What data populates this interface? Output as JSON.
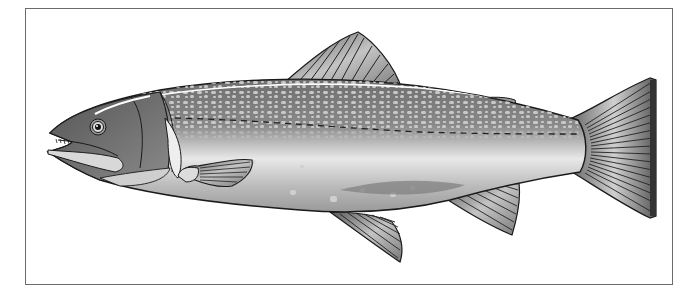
{
  "illustration": {
    "subject": "Trout (side view)",
    "style": "grayscale vector illustration",
    "colors": {
      "background": "#ffffff",
      "frame_border": "#6b6b6b",
      "outline": "#1a1a1a",
      "back_dark": "#7a7a7a",
      "spots_light": "#bdbdbd",
      "belly_light": "#e6e6e6",
      "fin_fill": "#a8a8a8",
      "head": "#6f6f6f"
    },
    "parts": [
      "head",
      "eye",
      "mouth",
      "gill-cover",
      "dorsal-fin",
      "adipose-fin",
      "pectoral-fin",
      "pelvic-fin",
      "anal-fin",
      "caudal-fin",
      "lateral-line",
      "body-spots"
    ]
  }
}
